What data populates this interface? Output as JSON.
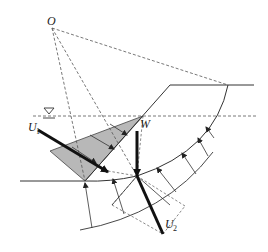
{
  "diagram": {
    "type": "slope-stability-slice-forces",
    "labels": {
      "center": "O",
      "weight": "W",
      "pore_force_1": "U",
      "pore_force_1_sub": "1",
      "pore_force_2": "U",
      "pore_force_2_sub": "2"
    },
    "icons": {
      "water_table": "inverted-triangle-water-symbol"
    },
    "colors": {
      "line": "#3a3a3a",
      "dashed": "#555555",
      "fill": "#b8b8b8",
      "force": "#111111"
    }
  }
}
